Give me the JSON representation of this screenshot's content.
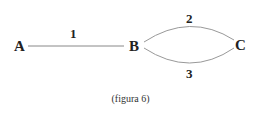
{
  "diagram": {
    "nodes": [
      {
        "id": "A",
        "label": "A"
      },
      {
        "id": "B",
        "label": "B"
      },
      {
        "id": "C",
        "label": "C"
      }
    ],
    "edges": [
      {
        "from": "A",
        "to": "B",
        "label": "1",
        "shape": "straight"
      },
      {
        "from": "B",
        "to": "C",
        "label": "2",
        "shape": "arc-upper"
      },
      {
        "from": "B",
        "to": "C",
        "label": "3",
        "shape": "arc-lower"
      }
    ],
    "caption": "(figura 6)"
  }
}
